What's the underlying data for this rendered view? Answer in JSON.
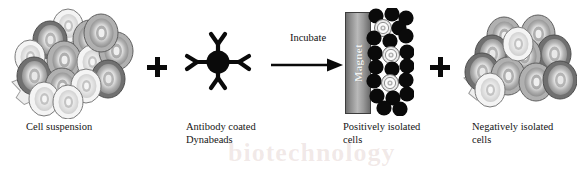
{
  "figure": {
    "watermark_text": "biotechnology"
  },
  "panels": {
    "cell_suspension": {
      "caption": "Cell suspension",
      "icon": "cell-cluster-icon"
    },
    "dynabeads": {
      "caption": "Antibody coated\nDynabeads",
      "icon": "antibody-coated-bead-icon"
    },
    "positively_isolated": {
      "caption": "Positively isolated\ncells",
      "icon": "magnet-bead-column-icon"
    },
    "negatively_isolated": {
      "caption": "Negatively isolated\ncells",
      "icon": "cell-cluster-icon"
    }
  },
  "process": {
    "incubate_label": "Incubate",
    "arrow": "right-arrow-icon",
    "plus_1": "plus-icon",
    "plus_2": "plus-icon"
  },
  "magnet": {
    "label": "Magnet"
  },
  "colors": {
    "bead_black": "#0a0a0a",
    "cell_rim_dark": "#6e6e6e",
    "cell_rim_mid": "#9a9a9a",
    "cell_body_light": "#d5d5d5",
    "cell_center": "#ffffff",
    "platelet": "#ededed",
    "magnet_gradient_light": "#b9b9b9",
    "magnet_gradient_dark": "#6a6a6a",
    "text": "#151515",
    "watermark": "#aa786e"
  }
}
